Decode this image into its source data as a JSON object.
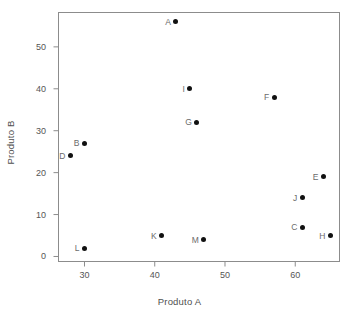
{
  "chart_data": {
    "type": "scatter",
    "title": "",
    "xlabel": "Produto A",
    "ylabel": "Produto B",
    "xlim": [
      26.3,
      66.3
    ],
    "ylim": [
      -1.2,
      58.2
    ],
    "xticks": [
      30,
      40,
      50,
      60
    ],
    "yticks": [
      0,
      10,
      20,
      30,
      40,
      50
    ],
    "grid": false,
    "legend": null,
    "marker_color": "#111111",
    "label_color": "#6b6b6b",
    "frame_color": "#8c8c8c",
    "points": [
      {
        "label": "A",
        "x": 43,
        "y": 56
      },
      {
        "label": "B",
        "x": 30,
        "y": 27
      },
      {
        "label": "C",
        "x": 61,
        "y": 7
      },
      {
        "label": "D",
        "x": 28,
        "y": 24
      },
      {
        "label": "E",
        "x": 64,
        "y": 19
      },
      {
        "label": "F",
        "x": 57,
        "y": 38
      },
      {
        "label": "G",
        "x": 46,
        "y": 32
      },
      {
        "label": "H",
        "x": 65,
        "y": 5
      },
      {
        "label": "I",
        "x": 45,
        "y": 40
      },
      {
        "label": "J",
        "x": 61,
        "y": 14
      },
      {
        "label": "K",
        "x": 41,
        "y": 5
      },
      {
        "label": "L",
        "x": 30,
        "y": 2
      },
      {
        "label": "M",
        "x": 47,
        "y": 4
      }
    ]
  }
}
